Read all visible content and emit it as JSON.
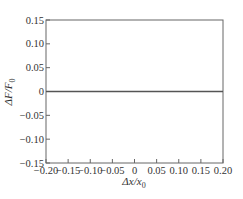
{
  "chart_data": {
    "type": "line",
    "title": "",
    "xlabel": "Δx/x0",
    "ylabel": "ΔF/F0",
    "xlim": [
      -0.2,
      0.2
    ],
    "ylim": [
      -0.15,
      0.15
    ],
    "grid": false,
    "legend": null,
    "x_ticks": [
      -0.2,
      -0.15,
      -0.1,
      -0.05,
      0,
      0.05,
      0.1,
      0.15,
      0.2
    ],
    "x_tick_labels": [
      "−0.20",
      "−0.15",
      "−0.10",
      "−0.05",
      "0",
      "0.05",
      "0.10",
      "0.15",
      "0.20"
    ],
    "y_ticks": [
      0.15,
      0.1,
      0.05,
      0,
      -0.05,
      -0.1,
      -0.15
    ],
    "y_tick_labels": [
      "0.15",
      "0.10",
      "0.05",
      "0",
      "−0.05",
      "−0.10",
      "−0.15"
    ],
    "series": [
      {
        "name": "ΔF/F0",
        "x": [
          -0.2,
          -0.15,
          -0.1,
          -0.05,
          0,
          0.05,
          0.1,
          0.15,
          0.2
        ],
        "values": [
          0,
          0,
          0,
          0,
          0,
          0,
          0,
          0,
          0
        ],
        "color": "#555555"
      }
    ]
  },
  "labels": {
    "xlabel_main": "Δx/x",
    "xlabel_sub": "0",
    "ylabel_main": "ΔF/F",
    "ylabel_sub": "0"
  }
}
